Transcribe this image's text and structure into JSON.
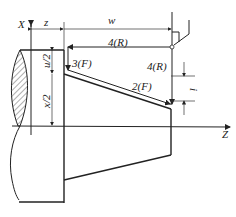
{
  "diagram": {
    "type": "lathe taper turning cycle schematic",
    "axes": {
      "x_label": "X",
      "z_label": "Z"
    },
    "dimensions": {
      "z": "z",
      "w": "w",
      "u_half": "u/2",
      "x_half": "x/2",
      "i": "i"
    },
    "path_labels": {
      "step1": "4(R)",
      "step2": "3(F)",
      "step3": "2(F)",
      "step4": "4(R)"
    }
  }
}
